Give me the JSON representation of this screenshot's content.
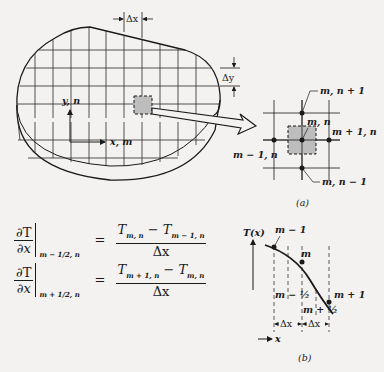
{
  "figure": {
    "body": {
      "dx_label": "Δx",
      "dy_label": "Δy",
      "axis_y_label": "y, n",
      "axis_x_label": "x, m"
    },
    "panel_a": {
      "caption": "(a)",
      "node_labels": {
        "top": "m, n + 1",
        "center": "m, n",
        "right": "m + 1, n",
        "left": "m − 1, n",
        "bottom": "m, n − 1"
      }
    },
    "panel_b": {
      "caption": "(b)",
      "y_axis_label": "T(x)",
      "x_axis_label": "x",
      "point_labels": [
        "m − 1",
        "m",
        "m + 1"
      ],
      "half_labels": [
        "m − ½",
        "m + ½"
      ],
      "spacing_labels": [
        "Δx",
        "Δx"
      ]
    },
    "equations": [
      {
        "lhs_num": "∂T",
        "lhs_den": "∂x",
        "eval_at": "m − 1/2, n",
        "rhs_num_a": "T",
        "rhs_num_a_sub": "m, n",
        "rhs_num_minus": " − ",
        "rhs_num_b": "T",
        "rhs_num_b_sub": "m − 1, n",
        "rhs_den": "Δx"
      },
      {
        "lhs_num": "∂T",
        "lhs_den": "∂x",
        "eval_at": "m + 1/2, n",
        "rhs_num_a": "T",
        "rhs_num_a_sub": "m + 1, n",
        "rhs_num_minus": " − ",
        "rhs_num_b": "T",
        "rhs_num_b_sub": "m, n",
        "rhs_den": "Δx"
      }
    ],
    "equals": "="
  }
}
